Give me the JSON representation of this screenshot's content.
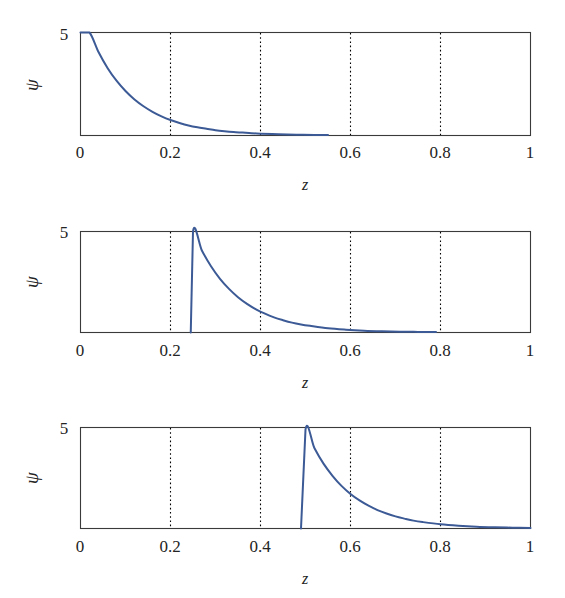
{
  "figure": {
    "background_color": "#ffffff",
    "curve_color": "#3c5a95",
    "frame_color": "#3a3a3a",
    "grid_color": "#000000",
    "panel_count": 3
  },
  "axes": {
    "x_label": "z",
    "y_label": "ψ",
    "x_ticks": [
      "0",
      "0.2",
      "0.4",
      "0.6",
      "0.8",
      "1"
    ],
    "x_tick_values": [
      0,
      0.2,
      0.4,
      0.6,
      0.8,
      1
    ],
    "y_ticks": [
      "0",
      "5"
    ],
    "y_tick_values": [
      0,
      5
    ],
    "xlim": [
      0,
      1
    ],
    "ylim": [
      0,
      5
    ],
    "gridlines_x": [
      0.2,
      0.4,
      0.6,
      0.8
    ],
    "grid_style": "dotted-vertical"
  },
  "chart_data": [
    {
      "type": "line",
      "title": "",
      "panel_index": 0,
      "xlabel": "z",
      "ylabel": "ψ",
      "xlim": [
        0,
        1
      ],
      "ylim": [
        0,
        5
      ],
      "xticks": [
        0,
        0.2,
        0.4,
        0.6,
        0.8,
        1
      ],
      "xticklabels": [
        "0",
        "0.2",
        "0.4",
        "0.6",
        "0.8",
        "1"
      ],
      "yticks": [
        0,
        5
      ],
      "yticklabels": [
        "0",
        "5"
      ],
      "grid": true,
      "legend": "none",
      "series": [
        {
          "name": "psi",
          "color": "#3c5a95",
          "peak_z": 0.02,
          "peak_value": 5,
          "description": "Exponential decay from peak 5 at z=0.02 toward 0",
          "x": [
            0.0,
            0.02,
            0.04,
            0.06,
            0.08,
            0.1,
            0.12,
            0.14,
            0.16,
            0.18,
            0.2,
            0.22,
            0.24,
            0.26,
            0.28,
            0.3,
            0.32,
            0.34,
            0.36,
            0.38,
            0.4,
            0.44,
            0.48,
            0.52,
            0.55
          ],
          "y": [
            5.0,
            5.0,
            4.05,
            3.28,
            2.66,
            2.16,
            1.75,
            1.42,
            1.15,
            0.93,
            0.75,
            0.61,
            0.49,
            0.4,
            0.33,
            0.26,
            0.21,
            0.17,
            0.14,
            0.11,
            0.09,
            0.06,
            0.04,
            0.03,
            0.02
          ]
        }
      ]
    },
    {
      "type": "line",
      "title": "",
      "panel_index": 1,
      "xlabel": "z",
      "ylabel": "ψ",
      "xlim": [
        0,
        1
      ],
      "ylim": [
        0,
        5
      ],
      "xticks": [
        0,
        0.2,
        0.4,
        0.6,
        0.8,
        1
      ],
      "xticklabels": [
        "0",
        "0.2",
        "0.4",
        "0.6",
        "0.8",
        "1"
      ],
      "yticks": [
        0,
        5
      ],
      "yticklabels": [
        "0",
        "5"
      ],
      "grid": true,
      "legend": "none",
      "series": [
        {
          "name": "psi",
          "color": "#3c5a95",
          "peak_z": 0.25,
          "peak_value": 5,
          "description": "Zero until z=0.245, sharp rise to 5 at z=0.25, then exponential decay",
          "x": [
            0.245,
            0.25,
            0.27,
            0.29,
            0.31,
            0.33,
            0.35,
            0.37,
            0.39,
            0.41,
            0.43,
            0.45,
            0.47,
            0.49,
            0.51,
            0.55,
            0.59,
            0.63,
            0.67,
            0.71,
            0.75,
            0.79
          ],
          "y": [
            0.0,
            5.0,
            4.05,
            3.28,
            2.66,
            2.16,
            1.75,
            1.42,
            1.15,
            0.93,
            0.75,
            0.61,
            0.49,
            0.4,
            0.33,
            0.21,
            0.14,
            0.09,
            0.06,
            0.04,
            0.03,
            0.02
          ]
        }
      ]
    },
    {
      "type": "line",
      "title": "",
      "panel_index": 2,
      "xlabel": "z",
      "ylabel": "ψ",
      "xlim": [
        0,
        1
      ],
      "ylim": [
        0,
        5
      ],
      "xticks": [
        0,
        0.2,
        0.4,
        0.6,
        0.8,
        1
      ],
      "xticklabels": [
        "0",
        "0.2",
        "0.4",
        "0.6",
        "0.8",
        "1"
      ],
      "yticks": [
        0,
        5
      ],
      "yticklabels": [
        "0",
        "5"
      ],
      "grid": true,
      "legend": "none",
      "series": [
        {
          "name": "psi",
          "color": "#3c5a95",
          "peak_z": 0.5,
          "peak_value": 4.9,
          "description": "Zero until z=0.49, sharp rise to ~4.9 at z=0.50, then exponential decay to ~0 at z=1",
          "x": [
            0.49,
            0.5,
            0.52,
            0.54,
            0.56,
            0.58,
            0.6,
            0.62,
            0.64,
            0.66,
            0.68,
            0.7,
            0.72,
            0.74,
            0.76,
            0.8,
            0.84,
            0.88,
            0.92,
            0.96,
            1.0
          ],
          "y": [
            0.0,
            4.9,
            3.97,
            3.21,
            2.61,
            2.11,
            1.71,
            1.39,
            1.13,
            0.91,
            0.74,
            0.6,
            0.49,
            0.39,
            0.32,
            0.21,
            0.14,
            0.09,
            0.06,
            0.04,
            0.02
          ]
        }
      ]
    }
  ]
}
